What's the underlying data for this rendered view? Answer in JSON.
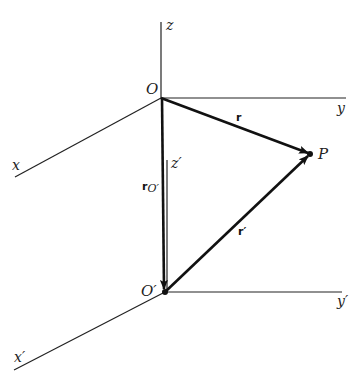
{
  "diagram": {
    "title": "",
    "points": {
      "O": {
        "label": "O",
        "x": 161,
        "y": 98
      },
      "O_prime": {
        "label": "O′",
        "x": 165,
        "y": 292
      },
      "P": {
        "label": "P",
        "x": 310,
        "y": 154
      }
    },
    "axes": {
      "z": {
        "label": "z"
      },
      "y": {
        "label": "y"
      },
      "x": {
        "label": "x"
      },
      "z_prime": {
        "label": "z′"
      },
      "y_prime": {
        "label": "y′"
      },
      "x_prime": {
        "label": "x′"
      }
    },
    "vectors": {
      "r": {
        "label": "r",
        "from": "O",
        "to": "P"
      },
      "r_prime": {
        "label": "r′",
        "from": "O_prime",
        "to": "P"
      },
      "r_O_prime": {
        "label": "r",
        "subscript": "O′",
        "from": "O",
        "to": "O_prime"
      }
    },
    "colors": {
      "line": "#222222",
      "vector": "#111111",
      "background": "#ffffff"
    }
  }
}
